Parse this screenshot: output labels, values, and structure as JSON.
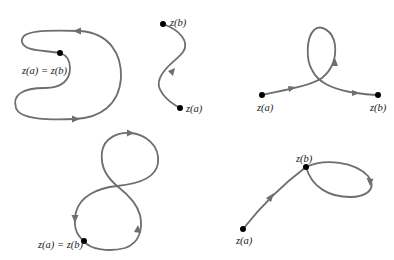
{
  "diagram": {
    "title": "",
    "colors": {
      "curve": "#6e6e6e",
      "point": "#000000",
      "text": "#222222"
    },
    "curves": [
      {
        "id": "closed-curve",
        "description": "Simple closed contour, C-shaped",
        "labels": [
          "z(a) = z(b)"
        ]
      },
      {
        "id": "simple-arc",
        "description": "Simple smooth arc (S-shaped)",
        "labels": [
          "z(b)",
          "z(a)"
        ]
      },
      {
        "id": "self-intersecting-arc",
        "description": "Arc with a loop (not simple)",
        "labels": [
          "z(a)",
          "z(b)"
        ]
      },
      {
        "id": "figure-eight",
        "description": "Closed contour, figure eight (not simple)",
        "labels": [
          "z(a) = z(b)"
        ]
      },
      {
        "id": "arc-with-loop-end",
        "description": "Arc ending in a loop through z(b)",
        "labels": [
          "z(b)",
          "z(a)"
        ]
      }
    ]
  },
  "labels": {
    "c1_start_end": "z(a) = z(b)",
    "c2_end": "z(b)",
    "c2_start": "z(a)",
    "c3_start": "z(a)",
    "c3_end": "z(b)",
    "c4_start_end": "z(a) = z(b)",
    "c5_end": "z(b)",
    "c5_start": "z(a)"
  }
}
